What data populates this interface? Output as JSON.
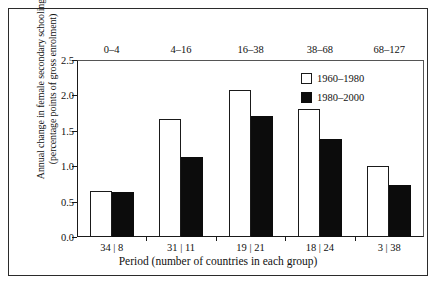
{
  "chart_data": {
    "type": "bar",
    "title": "",
    "xlabel": "Period (number of countries in each group)",
    "ylabel_line1": "Annual change in female secondary schooling",
    "ylabel_line2": "(percentage points of gross enrolment)",
    "ylim": [
      0.0,
      2.5
    ],
    "yticks": [
      "0.0",
      "0.5",
      "1.0",
      "1.5",
      "2.0",
      "2.5"
    ],
    "ytick_values": [
      0.0,
      0.5,
      1.0,
      1.5,
      2.0,
      2.5
    ],
    "grid": false,
    "legend_position": "top-right",
    "top_axis_label": "",
    "categories": [
      "0–4",
      "4–16",
      "16–38",
      "38–68",
      "68–127"
    ],
    "category_counts": [
      "34 | 8",
      "31 | 11",
      "19 | 21",
      "18 | 24",
      "3 | 38"
    ],
    "series": [
      {
        "name": "1960–1980",
        "style": "open",
        "color": "#ffffff",
        "edge_color": "#1a1a1a",
        "values": [
          0.65,
          1.66,
          2.08,
          1.81,
          1.0
        ]
      },
      {
        "name": "1980–2000",
        "style": "filled",
        "color": "#0c0c0c",
        "edge_color": "#0c0c0c",
        "values": [
          0.63,
          1.13,
          1.71,
          1.38,
          0.74
        ]
      }
    ]
  },
  "legend": {
    "items": [
      {
        "label": "1960–1980"
      },
      {
        "label": "1980–2000"
      }
    ]
  }
}
